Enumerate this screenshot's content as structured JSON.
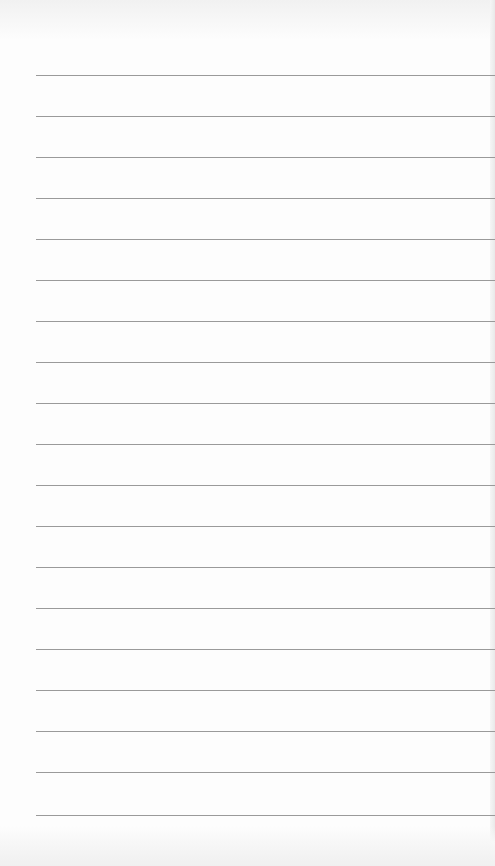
{
  "notepad": {
    "line_count": 19,
    "line_color": "#9a9a9a",
    "paper_color": "#fdfdfd",
    "lines": [
      {
        "text": ""
      },
      {
        "text": ""
      },
      {
        "text": ""
      },
      {
        "text": ""
      },
      {
        "text": ""
      },
      {
        "text": ""
      },
      {
        "text": ""
      },
      {
        "text": ""
      },
      {
        "text": ""
      },
      {
        "text": ""
      },
      {
        "text": ""
      },
      {
        "text": ""
      },
      {
        "text": ""
      },
      {
        "text": ""
      },
      {
        "text": ""
      },
      {
        "text": ""
      },
      {
        "text": ""
      },
      {
        "text": ""
      },
      {
        "text": ""
      }
    ]
  }
}
